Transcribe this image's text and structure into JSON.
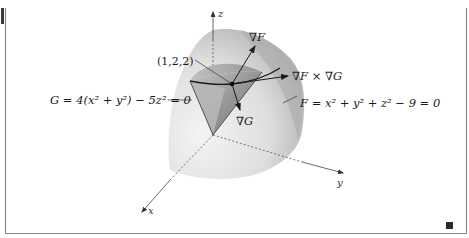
{
  "figure": {
    "labels": {
      "point": "(1,2,2)",
      "grad_f": "∇F",
      "cross": "∇F × ∇G",
      "grad_g": "∇G",
      "eq_g": "G = 4(x² + y²) − 5z² = 0",
      "eq_f": "F = x² + y² + z² − 9 = 0"
    },
    "axes": {
      "x": "x",
      "y": "y",
      "z": "z"
    },
    "colors": {
      "frame": "#8a8a8a",
      "tab": "#3a3a3a",
      "end_mark": "#2b2b2b",
      "sphere_light": "#f0f0f0",
      "sphere_dark": "#b5b5b5",
      "cone": "#9c9c9c",
      "ink": "#1a1a1a"
    }
  }
}
